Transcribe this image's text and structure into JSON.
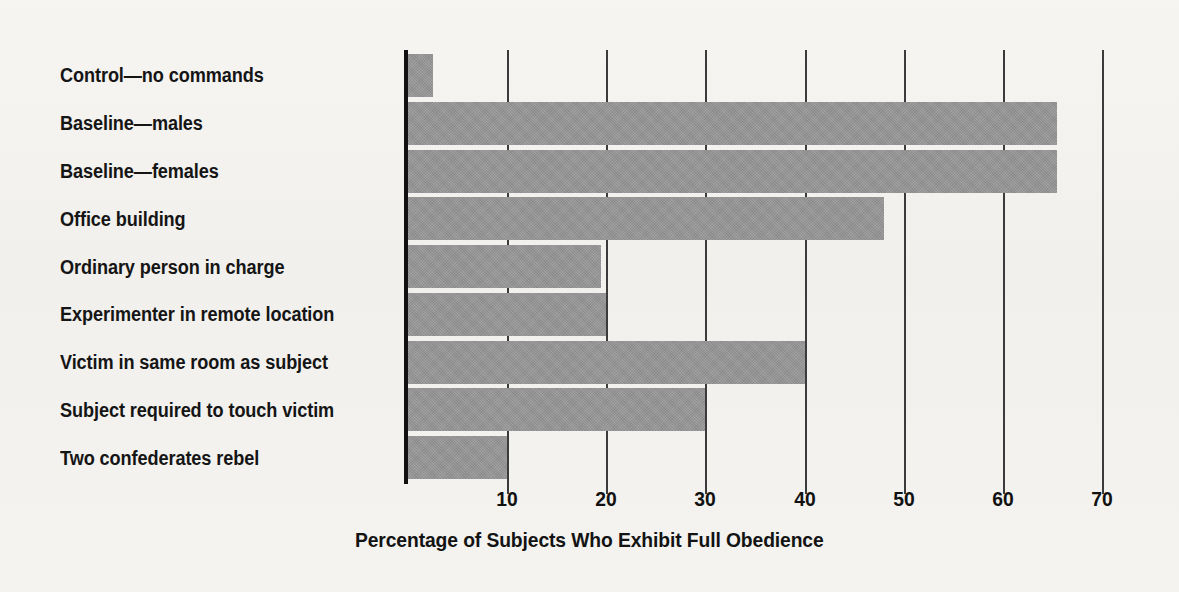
{
  "chart_data": {
    "type": "bar",
    "orientation": "horizontal",
    "title": "",
    "xlabel": "Percentage of Subjects Who Exhibit Full Obedience",
    "ylabel": "",
    "xlim": [
      0,
      70
    ],
    "xticks": [
      10,
      20,
      30,
      40,
      50,
      60,
      70
    ],
    "grid": true,
    "legend": "none",
    "bar_color": "#969696",
    "background_color": "#f3f2ef",
    "axis_color": "#111111",
    "categories": [
      "Control—no commands",
      "Baseline—males",
      "Baseline—females",
      "Office building",
      "Ordinary person in charge",
      "Experimenter in remote location",
      "Victim in same room as subject",
      "Subject required to touch victim",
      "Two confederates rebel"
    ],
    "values": [
      2.5,
      65.5,
      65.5,
      48,
      19.5,
      20,
      40,
      30,
      10
    ]
  }
}
